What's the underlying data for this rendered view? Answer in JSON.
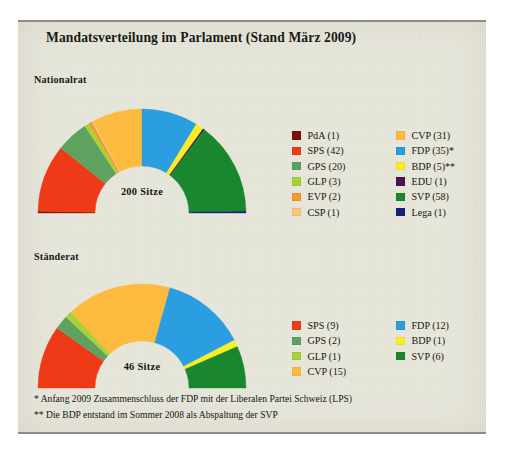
{
  "title": "Mandatsverteilung im Parlament (Stand März 2009)",
  "chambers": {
    "nationalrat": {
      "label": "Nationalrat",
      "seats_label": "200 Sitze"
    },
    "staenderat": {
      "label": "Ständerat",
      "seats_label": "46 Sitze"
    }
  },
  "footnotes": {
    "one": "* Anfang 2009 Zusammenschluss der FDP mit der Liberalen Partei Schweiz (LPS)",
    "two": "** Die BDP entstand im Sommer 2008 als Abspaltung der SVP"
  },
  "source": "Quelle Daten: Bundesamt für Statistik (BFU)",
  "colors": {
    "PdA": "#7d1008",
    "SPS": "#ee3a16",
    "GPS": "#5fa25f",
    "GLP": "#a8d13a",
    "EVP": "#f5992c",
    "CSP": "#f8c97a",
    "CVP": "#fcbb3e",
    "FDP": "#2a9ee0",
    "BDP": "#fbed23",
    "EDU": "#4a1352",
    "SVP": "#18872e",
    "Lega": "#17207a",
    "background": "#e6e5da",
    "rule": "#8d8c82"
  },
  "chart_data": [
    {
      "type": "pie",
      "title": "Nationalrat",
      "variant": "semicircle-donut",
      "total": 200,
      "total_label": "200 Sitze",
      "categories": [
        "PdA",
        "SPS",
        "GPS",
        "GLP",
        "EVP",
        "CSP",
        "CVP",
        "FDP",
        "BDP",
        "EDU",
        "SVP",
        "Lega"
      ],
      "values": [
        1,
        42,
        20,
        3,
        2,
        1,
        31,
        35,
        5,
        1,
        58,
        1
      ],
      "legend": [
        {
          "label": "PdA (1)",
          "party": "PdA",
          "seats": 1,
          "color": "#7d1008"
        },
        {
          "label": "SPS (42)",
          "party": "SPS",
          "seats": 42,
          "color": "#ee3a16"
        },
        {
          "label": "GPS (20)",
          "party": "GPS",
          "seats": 20,
          "color": "#5fa25f"
        },
        {
          "label": "GLP (3)",
          "party": "GLP",
          "seats": 3,
          "color": "#a8d13a"
        },
        {
          "label": "EVP (2)",
          "party": "EVP",
          "seats": 2,
          "color": "#f5992c"
        },
        {
          "label": "CSP (1)",
          "party": "CSP",
          "seats": 1,
          "color": "#f8c97a"
        },
        {
          "label": "CVP (31)",
          "party": "CVP",
          "seats": 31,
          "color": "#fcbb3e"
        },
        {
          "label": "FDP (35)*",
          "party": "FDP",
          "seats": 35,
          "color": "#2a9ee0"
        },
        {
          "label": "BDP (5)**",
          "party": "BDP",
          "seats": 5,
          "color": "#fbed23"
        },
        {
          "label": "EDU (1)",
          "party": "EDU",
          "seats": 1,
          "color": "#4a1352"
        },
        {
          "label": "SVP (58)",
          "party": "SVP",
          "seats": 58,
          "color": "#18872e"
        },
        {
          "label": "Lega (1)",
          "party": "Lega",
          "seats": 1,
          "color": "#17207a"
        }
      ],
      "legend_position": "right",
      "legend_columns": 2
    },
    {
      "type": "pie",
      "title": "Ständerat",
      "variant": "semicircle-donut",
      "total": 46,
      "total_label": "46 Sitze",
      "categories": [
        "SPS",
        "GPS",
        "GLP",
        "CVP",
        "FDP",
        "BDP",
        "SVP"
      ],
      "values": [
        9,
        2,
        1,
        15,
        12,
        1,
        6
      ],
      "legend": [
        {
          "label": "SPS (9)",
          "party": "SPS",
          "seats": 9,
          "color": "#ee3a16"
        },
        {
          "label": "GPS (2)",
          "party": "GPS",
          "seats": 2,
          "color": "#5fa25f"
        },
        {
          "label": "GLP (1)",
          "party": "GLP",
          "seats": 1,
          "color": "#a8d13a"
        },
        {
          "label": "CVP (15)",
          "party": "CVP",
          "seats": 15,
          "color": "#fcbb3e"
        },
        {
          "label": "FDP (12)",
          "party": "FDP",
          "seats": 12,
          "color": "#2a9ee0"
        },
        {
          "label": "BDP (1)",
          "party": "BDP",
          "seats": 1,
          "color": "#fbed23"
        },
        {
          "label": "SVP (6)",
          "party": "SVP",
          "seats": 6,
          "color": "#18872e"
        }
      ],
      "legend_position": "right",
      "legend_columns": 2
    }
  ]
}
